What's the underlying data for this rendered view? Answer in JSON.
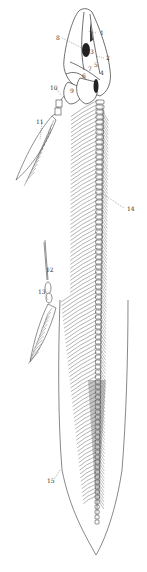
{
  "figure": {
    "background": "#ffffff",
    "ink": "#333333",
    "labels": [
      {
        "text": "1",
        "x": 100,
        "y": 35
      },
      {
        "text": "2",
        "x": 106,
        "y": 60
      },
      {
        "text": "3",
        "x": 90,
        "y": 54
      },
      {
        "text": "4",
        "x": 100,
        "y": 75
      },
      {
        "text": "5",
        "x": 94,
        "y": 67
      },
      {
        "text": "6",
        "x": 82,
        "y": 78
      },
      {
        "text": "7",
        "x": 88,
        "y": 71
      },
      {
        "text": "8",
        "x": 56,
        "y": 40
      },
      {
        "text": "9",
        "x": 70,
        "y": 93
      },
      {
        "text": "10",
        "x": 50,
        "y": 90
      },
      {
        "text": "11",
        "x": 36,
        "y": 124
      },
      {
        "text": "12",
        "x": 46,
        "y": 272
      },
      {
        "text": "13",
        "x": 38,
        "y": 294
      },
      {
        "text": "14",
        "x": 127,
        "y": 211
      },
      {
        "text": "15",
        "x": 47,
        "y": 483
      }
    ]
  }
}
